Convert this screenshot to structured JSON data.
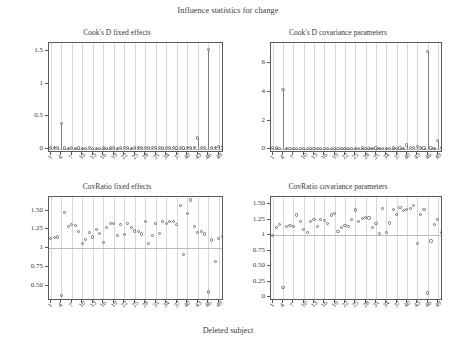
{
  "figure": {
    "title": "Influence statistics for change",
    "xlabel": "Deleted subject"
  },
  "chart_data": [
    {
      "type": "scatter",
      "panel": "top-left",
      "title": "Cook's D fixed effects",
      "xlabel": "Deleted subject",
      "ylabel": "",
      "ylim": [
        -0.06,
        1.62
      ],
      "xlim": [
        0.5,
        50.5
      ],
      "yticks": [
        0,
        0.5,
        1,
        1.5
      ],
      "ytick_labels": [
        "0",
        "0.5",
        "1",
        "1.5"
      ],
      "xticks": [
        1,
        4,
        7,
        10,
        13,
        16,
        19,
        22,
        25,
        28,
        31,
        34,
        37,
        40,
        43,
        46,
        49
      ],
      "xtick_labels": [
        "1",
        "4",
        "7",
        "10",
        "13",
        "16",
        "19",
        "22",
        "25",
        "28",
        "31",
        "34",
        "37",
        "40",
        "43",
        "46",
        "49"
      ],
      "grid": "vertical",
      "marker": "open-circle",
      "stems": true,
      "x": [
        1,
        2,
        3,
        4,
        5,
        6,
        7,
        8,
        9,
        10,
        11,
        12,
        13,
        14,
        15,
        16,
        17,
        18,
        19,
        20,
        21,
        22,
        23,
        24,
        25,
        26,
        27,
        28,
        29,
        30,
        31,
        32,
        33,
        34,
        35,
        36,
        37,
        38,
        39,
        40,
        41,
        42,
        43,
        44,
        45,
        46,
        47,
        48,
        49,
        50
      ],
      "values": [
        0.02,
        0.025,
        0.018,
        0.39,
        0.015,
        0.012,
        0.02,
        0.014,
        0.016,
        0.01,
        0.012,
        0.018,
        0.014,
        0.011,
        0.013,
        0.016,
        0.012,
        0.015,
        0.02,
        0.013,
        0.018,
        0.022,
        0.019,
        0.014,
        0.025,
        0.03,
        0.028,
        0.022,
        0.018,
        0.02,
        0.024,
        0.019,
        0.016,
        0.021,
        0.018,
        0.022,
        0.017,
        0.02,
        0.015,
        0.026,
        0.03,
        0.028,
        0.17,
        0.022,
        0.02,
        1.52,
        0.018,
        0.03,
        0.045,
        0.035
      ]
    },
    {
      "type": "scatter",
      "panel": "top-right",
      "title": "Cook's D covariance parameters",
      "xlabel": "Deleted subject",
      "ylabel": "",
      "ylim": [
        -0.25,
        7.4
      ],
      "xlim": [
        0.5,
        50.5
      ],
      "yticks": [
        0,
        2,
        4,
        6
      ],
      "ytick_labels": [
        "0",
        "2",
        "4",
        "6"
      ],
      "xticks": [
        1,
        4,
        7,
        10,
        13,
        16,
        19,
        22,
        25,
        28,
        31,
        34,
        37,
        40,
        43,
        46,
        49
      ],
      "xtick_labels": [
        "1",
        "4",
        "7",
        "10",
        "13",
        "16",
        "19",
        "22",
        "25",
        "28",
        "31",
        "34",
        "37",
        "40",
        "43",
        "46",
        "49"
      ],
      "grid": "vertical",
      "marker": "open-circle",
      "stems": true,
      "x": [
        1,
        2,
        3,
        4,
        5,
        6,
        7,
        8,
        9,
        10,
        11,
        12,
        13,
        14,
        15,
        16,
        17,
        18,
        19,
        20,
        21,
        22,
        23,
        24,
        25,
        26,
        27,
        28,
        29,
        30,
        31,
        32,
        33,
        34,
        35,
        36,
        37,
        38,
        39,
        40,
        41,
        42,
        43,
        44,
        45,
        46,
        47,
        48,
        49,
        50
      ],
      "values": [
        0.12,
        0.1,
        0.08,
        4.15,
        0.07,
        0.06,
        0.05,
        0.06,
        0.05,
        0.04,
        0.05,
        0.06,
        0.05,
        0.04,
        0.05,
        0.06,
        0.07,
        0.05,
        0.06,
        0.05,
        0.07,
        0.08,
        0.06,
        0.05,
        0.08,
        0.09,
        0.1,
        0.08,
        0.07,
        0.08,
        0.1,
        0.09,
        0.07,
        0.09,
        0.08,
        0.1,
        0.09,
        0.1,
        0.08,
        0.3,
        0.12,
        0.12,
        0.2,
        0.12,
        0.1,
        6.8,
        0.1,
        0.08,
        0.6,
        0.12
      ]
    },
    {
      "type": "scatter",
      "panel": "bottom-left",
      "title": "CovRatio fixed effects",
      "xlabel": "Deleted subject",
      "ylabel": "",
      "ylim": [
        0.3,
        1.68
      ],
      "xlim": [
        0.5,
        50.5
      ],
      "yticks": [
        0.5,
        0.75,
        1,
        1.25,
        1.5
      ],
      "ytick_labels": [
        "0.50",
        "0.75",
        "1",
        "1.25",
        "1.50"
      ],
      "xticks": [
        1,
        4,
        7,
        10,
        13,
        16,
        19,
        22,
        25,
        28,
        31,
        34,
        37,
        40,
        43,
        46,
        49
      ],
      "xtick_labels": [
        "1",
        "4",
        "7",
        "10",
        "13",
        "16",
        "19",
        "22",
        "25",
        "28",
        "31",
        "34",
        "37",
        "40",
        "43",
        "46",
        "49"
      ],
      "grid": "vertical",
      "marker": "open-circle",
      "stems": false,
      "reference_line": 1,
      "x": [
        1,
        2,
        3,
        4,
        5,
        6,
        7,
        8,
        9,
        10,
        11,
        12,
        13,
        14,
        15,
        16,
        17,
        18,
        19,
        20,
        21,
        22,
        23,
        24,
        25,
        26,
        27,
        28,
        29,
        30,
        31,
        32,
        33,
        34,
        35,
        36,
        37,
        38,
        39,
        40,
        41,
        42,
        43,
        44,
        45,
        46,
        47,
        48,
        49,
        50
      ],
      "values": [
        1.13,
        1.14,
        1.15,
        0.37,
        1.47,
        1.29,
        1.31,
        1.3,
        1.22,
        1.06,
        1.12,
        1.21,
        1.15,
        1.25,
        1.2,
        1.08,
        1.28,
        1.33,
        1.33,
        1.17,
        1.32,
        1.18,
        1.33,
        1.27,
        1.23,
        1.22,
        1.19,
        1.35,
        1.06,
        1.17,
        1.33,
        1.2,
        1.35,
        1.33,
        1.35,
        1.36,
        1.32,
        1.57,
        0.92,
        1.46,
        1.64,
        1.29,
        1.21,
        1.22,
        1.19,
        0.42,
        1.11,
        0.82,
        1.13,
        1.16
      ]
    },
    {
      "type": "scatter",
      "panel": "bottom-right",
      "title": "CovRatio covariance parameters",
      "xlabel": "Deleted subject",
      "ylabel": "",
      "ylim": [
        -0.06,
        1.62
      ],
      "xlim": [
        0.5,
        50.5
      ],
      "yticks": [
        0,
        0.25,
        0.5,
        0.75,
        1,
        1.25,
        1.5
      ],
      "ytick_labels": [
        "0",
        "0.25",
        "0.50",
        "0.75",
        "1",
        "1.25",
        "1.50"
      ],
      "xticks": [
        1,
        4,
        7,
        10,
        13,
        16,
        19,
        22,
        25,
        28,
        31,
        34,
        37,
        40,
        43,
        46,
        49
      ],
      "xtick_labels": [
        "1",
        "4",
        "7",
        "10",
        "13",
        "16",
        "19",
        "22",
        "25",
        "28",
        "31",
        "34",
        "37",
        "40",
        "43",
        "46",
        "49"
      ],
      "grid": "vertical",
      "marker": "open-circle",
      "stems": false,
      "reference_line": 1,
      "x": [
        1,
        2,
        3,
        4,
        5,
        6,
        7,
        8,
        9,
        10,
        11,
        12,
        13,
        14,
        15,
        16,
        17,
        18,
        19,
        20,
        21,
        22,
        23,
        24,
        25,
        26,
        27,
        28,
        29,
        30,
        31,
        32,
        33,
        34,
        35,
        36,
        37,
        38,
        39,
        40,
        41,
        42,
        43,
        44,
        45,
        46,
        47,
        48,
        49,
        50
      ],
      "values": [
        1.0,
        1.13,
        1.17,
        0.16,
        1.15,
        1.16,
        1.14,
        1.33,
        1.22,
        1.1,
        1.04,
        1.22,
        1.26,
        1.14,
        1.25,
        1.24,
        1.19,
        1.33,
        1.35,
        1.06,
        1.13,
        1.16,
        1.14,
        1.26,
        1.41,
        1.22,
        1.27,
        1.29,
        1.28,
        1.13,
        1.19,
        1.03,
        1.44,
        1.05,
        1.2,
        1.42,
        1.34,
        1.45,
        1.4,
        1.42,
        1.43,
        1.48,
        0.87,
        1.34,
        1.42,
        0.07,
        0.91,
        1.18,
        1.25,
        1.04,
        0.7,
        1.16
      ]
    }
  ]
}
